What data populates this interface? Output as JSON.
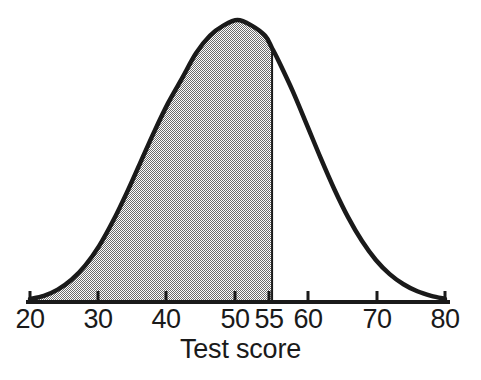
{
  "chart_data": {
    "type": "area",
    "title": "",
    "subtitle": "",
    "xlabel": "Test score",
    "ylabel": "",
    "xlim": [
      20,
      80
    ],
    "ylim": [
      0,
      1
    ],
    "grid": false,
    "legend": null,
    "distribution": {
      "kind": "normal",
      "mean": 50,
      "sd": 10
    },
    "xticks": [
      {
        "value": 20,
        "label": "20",
        "px": 30
      },
      {
        "value": 30,
        "label": "30",
        "px": 98
      },
      {
        "value": 40,
        "label": "40",
        "px": 166
      },
      {
        "value": 50,
        "label": "50",
        "px": 235
      },
      {
        "value": 55,
        "label": "55",
        "px": 269
      },
      {
        "value": 60,
        "label": "60",
        "px": 308
      },
      {
        "value": 70,
        "label": "70",
        "px": 377
      },
      {
        "value": 80,
        "label": "80",
        "px": 445
      }
    ],
    "shaded_region": {
      "from": 20,
      "to": 55,
      "fill": "#a6a6a6",
      "description": "Area under the normal curve from the left tail up to a test score of 55"
    },
    "curve": {
      "stroke": "#1a1a1a",
      "stroke_width": 4,
      "points": [
        {
          "x": 20,
          "y": 0.011
        },
        {
          "x": 22,
          "y": 0.022
        },
        {
          "x": 24,
          "y": 0.044
        },
        {
          "x": 26,
          "y": 0.079
        },
        {
          "x": 28,
          "y": 0.13
        },
        {
          "x": 30,
          "y": 0.199
        },
        {
          "x": 32,
          "y": 0.287
        },
        {
          "x": 34,
          "y": 0.388
        },
        {
          "x": 36,
          "y": 0.497
        },
        {
          "x": 38,
          "y": 0.606
        },
        {
          "x": 40,
          "y": 0.707
        },
        {
          "x": 42,
          "y": 0.794
        },
        {
          "x": 44,
          "y": 0.882
        },
        {
          "x": 46,
          "y": 0.944
        },
        {
          "x": 48,
          "y": 0.981
        },
        {
          "x": 50,
          "y": 1.0
        },
        {
          "x": 52,
          "y": 0.981
        },
        {
          "x": 54,
          "y": 0.944
        },
        {
          "x": 55,
          "y": 0.9
        },
        {
          "x": 56,
          "y": 0.852
        },
        {
          "x": 58,
          "y": 0.747
        },
        {
          "x": 60,
          "y": 0.63
        },
        {
          "x": 62,
          "y": 0.512
        },
        {
          "x": 64,
          "y": 0.4
        },
        {
          "x": 66,
          "y": 0.3
        },
        {
          "x": 68,
          "y": 0.216
        },
        {
          "x": 70,
          "y": 0.149
        },
        {
          "x": 72,
          "y": 0.099
        },
        {
          "x": 74,
          "y": 0.063
        },
        {
          "x": 76,
          "y": 0.038
        },
        {
          "x": 78,
          "y": 0.022
        },
        {
          "x": 80,
          "y": 0.011
        }
      ]
    }
  },
  "axis": {
    "title": "Test score",
    "tick_labels": [
      "20",
      "30",
      "40",
      "50",
      "55",
      "60",
      "70",
      "80"
    ],
    "line_color": "#1a1a1a"
  },
  "colors": {
    "background": "#ffffff",
    "ink": "#1a1a1a",
    "shade": "#a6a6a6"
  }
}
